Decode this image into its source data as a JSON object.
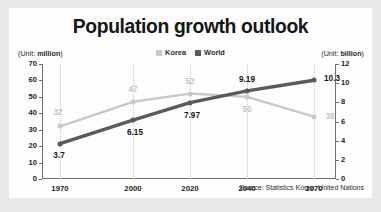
{
  "chart_data": {
    "type": "line",
    "title": "Population growth outlook",
    "xlabel": "",
    "ylabel": "",
    "grid": "vertical-dotted",
    "legend_position": "top-center",
    "categories": [
      "1970",
      "2000",
      "2020",
      "2040",
      "2070"
    ],
    "x": [
      1970,
      2000,
      2020,
      2040,
      2070
    ],
    "axes": {
      "left": {
        "unit_label": "(Unit: million)",
        "unit_prefix": "(Unit: ",
        "unit_value": "million",
        "unit_suffix": ")",
        "ticks": [
          "70",
          "60",
          "50",
          "40",
          "30",
          "20",
          "10",
          "0"
        ],
        "ylim": [
          0,
          70
        ]
      },
      "right": {
        "unit_label": "(Unit: billion)",
        "unit_prefix": "(Unit: ",
        "unit_value": "billion",
        "unit_suffix": ")",
        "ticks": [
          "12",
          "10",
          "8",
          "6",
          "4",
          "2",
          "0"
        ],
        "ylim": [
          0,
          12
        ]
      }
    },
    "series": [
      {
        "name": "Korea",
        "axis": "left",
        "unit": "million",
        "color": "#c9c9c9",
        "values": [
          32,
          47,
          52,
          50,
          38
        ],
        "labels": [
          "32",
          "47",
          "52",
          "50",
          "38"
        ]
      },
      {
        "name": "World",
        "axis": "right",
        "unit": "billion",
        "color": "#5a5a5a",
        "values": [
          3.7,
          6.15,
          7.97,
          9.19,
          10.3
        ],
        "labels": [
          "3.7",
          "6.15",
          "7.97",
          "9.19",
          "10.3"
        ]
      }
    ],
    "source": "Source: Statistics Korea, United Nations"
  },
  "legend": {
    "items": [
      {
        "label": "Korea",
        "color": "#c9c9c9"
      },
      {
        "label": "World",
        "color": "#5a5a5a"
      }
    ]
  },
  "colors": {
    "korea": "#c9c9c9",
    "world": "#5a5a5a",
    "axis": "#6f6f6f",
    "grid": "#c6c6c6",
    "text": "#1d1d1d",
    "card": "#fdfdfd",
    "page": "#e9e9e9"
  }
}
